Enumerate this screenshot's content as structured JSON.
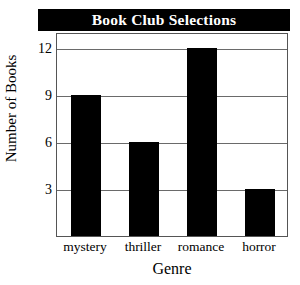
{
  "chart_data": {
    "type": "bar",
    "title": "Book Club Selections",
    "xlabel": "Genre",
    "ylabel": "Number of Books",
    "categories": [
      "mystery",
      "thriller",
      "romance",
      "horror"
    ],
    "values": [
      9,
      6,
      12,
      3
    ],
    "ylim": [
      0,
      13
    ],
    "yticks": [
      3,
      6,
      9,
      12
    ],
    "ytick_labels": [
      "3",
      "6",
      "9",
      "12"
    ],
    "grid": true,
    "legend": "none",
    "bar_color": "#000000",
    "title_background": "#000000",
    "title_color": "#ffffff",
    "grid_color": "#6a6a6a",
    "plot_background": "#ffffff"
  }
}
